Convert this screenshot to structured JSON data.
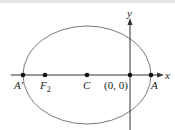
{
  "diagram": {
    "type": "ellipse-on-axes",
    "axes": {
      "x_label": "x",
      "y_label": "y"
    },
    "points": [
      {
        "id": "A_prime",
        "label": "A′"
      },
      {
        "id": "F2",
        "label": "F",
        "sub": "2"
      },
      {
        "id": "C",
        "label": "C"
      },
      {
        "id": "origin",
        "label": "(0, 0)"
      },
      {
        "id": "A",
        "label": "A"
      }
    ],
    "colors": {
      "ellipse": "#7a7a7a",
      "axes": "#333333",
      "points": "#111111"
    }
  }
}
